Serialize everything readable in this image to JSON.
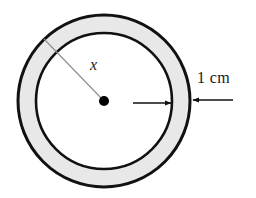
{
  "figure": {
    "type": "annulus-diagram",
    "background_color": "#ffffff",
    "band_fill_color": "#e8e8e8",
    "stroke_color": "#111111",
    "leader_line_color": "#8c8c8c",
    "center_dot_color": "#000000"
  },
  "labels": {
    "radius": "x",
    "band_width": "1 cm"
  },
  "geometry": {
    "center_x": 104,
    "center_y": 101,
    "outer_radius": 86,
    "inner_radius": 68,
    "outer_stroke_width": 3,
    "inner_stroke_width": 2.6,
    "center_dot_radius": 5
  },
  "radius_line": {
    "from_x": 104,
    "from_y": 101,
    "to_x": 44,
    "to_y": 39,
    "stroke_width": 1.1
  },
  "arrows": [
    {
      "name": "inner-band-arrow",
      "direction": "right",
      "tail_x": 133,
      "tail_y": 103,
      "tip_x": 171,
      "tip_y": 103
    },
    {
      "name": "outer-band-arrow",
      "direction": "left",
      "tail_x": 233,
      "tail_y": 100,
      "tip_x": 193,
      "tip_y": 100
    }
  ]
}
